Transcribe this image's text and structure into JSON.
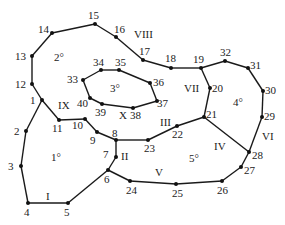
{
  "diagram": {
    "type": "planar-graph",
    "colors": {
      "stroke": "#1a1a1a",
      "text": "#222222",
      "background": "#ffffff"
    },
    "vertices": [
      {
        "id": "1",
        "x": 42,
        "y": 100,
        "lx": 30,
        "ly": 104
      },
      {
        "id": "2",
        "x": 26,
        "y": 131,
        "lx": 14,
        "ly": 135
      },
      {
        "id": "3",
        "x": 21,
        "y": 166,
        "lx": 8,
        "ly": 170
      },
      {
        "id": "4",
        "x": 28,
        "y": 203,
        "lx": 24,
        "ly": 216
      },
      {
        "id": "5",
        "x": 68,
        "y": 203,
        "lx": 64,
        "ly": 216
      },
      {
        "id": "6",
        "x": 108,
        "y": 170,
        "lx": 104,
        "ly": 183
      },
      {
        "id": "7",
        "x": 116,
        "y": 157,
        "lx": 103,
        "ly": 158
      },
      {
        "id": "8",
        "x": 116,
        "y": 140,
        "lx": 112,
        "ly": 137
      },
      {
        "id": "9",
        "x": 97,
        "y": 132,
        "lx": 90,
        "ly": 144
      },
      {
        "id": "10",
        "x": 85,
        "y": 119,
        "lx": 72,
        "ly": 129
      },
      {
        "id": "11",
        "x": 59,
        "y": 120,
        "lx": 52,
        "ly": 132
      },
      {
        "id": "12",
        "x": 32,
        "y": 84,
        "lx": 15,
        "ly": 88
      },
      {
        "id": "13",
        "x": 32,
        "y": 56,
        "lx": 15,
        "ly": 60
      },
      {
        "id": "14",
        "x": 52,
        "y": 33,
        "lx": 38,
        "ly": 33
      },
      {
        "id": "15",
        "x": 95,
        "y": 24,
        "lx": 88,
        "ly": 19
      },
      {
        "id": "16",
        "x": 116,
        "y": 37,
        "lx": 114,
        "ly": 33
      },
      {
        "id": "17",
        "x": 143,
        "y": 60,
        "lx": 139,
        "ly": 55
      },
      {
        "id": "18",
        "x": 171,
        "y": 68,
        "lx": 165,
        "ly": 62
      },
      {
        "id": "19",
        "x": 201,
        "y": 68,
        "lx": 193,
        "ly": 63
      },
      {
        "id": "20",
        "x": 210,
        "y": 88,
        "lx": 212,
        "ly": 92
      },
      {
        "id": "21",
        "x": 204,
        "y": 117,
        "lx": 206,
        "ly": 118
      },
      {
        "id": "22",
        "x": 177,
        "y": 126,
        "lx": 172,
        "ly": 138
      },
      {
        "id": "23",
        "x": 148,
        "y": 140,
        "lx": 144,
        "ly": 152
      },
      {
        "id": "24",
        "x": 130,
        "y": 181,
        "lx": 126,
        "ly": 194
      },
      {
        "id": "25",
        "x": 176,
        "y": 184,
        "lx": 172,
        "ly": 197
      },
      {
        "id": "26",
        "x": 222,
        "y": 181,
        "lx": 217,
        "ly": 194
      },
      {
        "id": "27",
        "x": 241,
        "y": 167,
        "lx": 244,
        "ly": 174
      },
      {
        "id": "28",
        "x": 249,
        "y": 152,
        "lx": 252,
        "ly": 159
      },
      {
        "id": "29",
        "x": 262,
        "y": 117,
        "lx": 264,
        "ly": 120
      },
      {
        "id": "30",
        "x": 263,
        "y": 91,
        "lx": 265,
        "ly": 94
      },
      {
        "id": "31",
        "x": 248,
        "y": 68,
        "lx": 250,
        "ly": 69
      },
      {
        "id": "32",
        "x": 225,
        "y": 61,
        "lx": 220,
        "ly": 56
      },
      {
        "id": "33",
        "x": 83,
        "y": 80,
        "lx": 67,
        "ly": 83
      },
      {
        "id": "34",
        "x": 101,
        "y": 70,
        "lx": 93,
        "ly": 66
      },
      {
        "id": "35",
        "x": 119,
        "y": 70,
        "lx": 115,
        "ly": 66
      },
      {
        "id": "36",
        "x": 150,
        "y": 83,
        "lx": 153,
        "ly": 86
      },
      {
        "id": "37",
        "x": 157,
        "y": 101,
        "lx": 157,
        "ly": 107
      },
      {
        "id": "38",
        "x": 133,
        "y": 108,
        "lx": 130,
        "ly": 119
      },
      {
        "id": "39",
        "x": 102,
        "y": 104,
        "lx": 95,
        "ly": 116
      },
      {
        "id": "40",
        "x": 90,
        "y": 98,
        "lx": 77,
        "ly": 107
      }
    ],
    "edges": [
      [
        "1",
        "2"
      ],
      [
        "2",
        "3"
      ],
      [
        "3",
        "4"
      ],
      [
        "4",
        "5"
      ],
      [
        "5",
        "6"
      ],
      [
        "6",
        "7"
      ],
      [
        "7",
        "8"
      ],
      [
        "8",
        "9"
      ],
      [
        "9",
        "10"
      ],
      [
        "10",
        "11"
      ],
      [
        "11",
        "1"
      ],
      [
        "1",
        "12"
      ],
      [
        "12",
        "13"
      ],
      [
        "13",
        "14"
      ],
      [
        "14",
        "15"
      ],
      [
        "15",
        "16"
      ],
      [
        "16",
        "17"
      ],
      [
        "17",
        "18"
      ],
      [
        "18",
        "19"
      ],
      [
        "19",
        "20"
      ],
      [
        "20",
        "21"
      ],
      [
        "21",
        "22"
      ],
      [
        "22",
        "23"
      ],
      [
        "23",
        "8"
      ],
      [
        "19",
        "32"
      ],
      [
        "32",
        "31"
      ],
      [
        "31",
        "30"
      ],
      [
        "30",
        "29"
      ],
      [
        "29",
        "28"
      ],
      [
        "28",
        "21"
      ],
      [
        "6",
        "24"
      ],
      [
        "24",
        "25"
      ],
      [
        "25",
        "26"
      ],
      [
        "26",
        "27"
      ],
      [
        "27",
        "28"
      ],
      [
        "33",
        "34"
      ],
      [
        "34",
        "35"
      ],
      [
        "35",
        "36"
      ],
      [
        "36",
        "37"
      ],
      [
        "37",
        "38"
      ],
      [
        "38",
        "39"
      ],
      [
        "39",
        "40"
      ],
      [
        "40",
        "33"
      ]
    ],
    "edge_labels": [
      {
        "text": "I",
        "x": 46,
        "y": 200
      },
      {
        "text": "II",
        "x": 121,
        "y": 160
      },
      {
        "text": "III",
        "x": 160,
        "y": 126
      },
      {
        "text": "IV",
        "x": 214,
        "y": 150
      },
      {
        "text": "V",
        "x": 155,
        "y": 176
      },
      {
        "text": "VI",
        "x": 262,
        "y": 140
      },
      {
        "text": "VII",
        "x": 184,
        "y": 92
      },
      {
        "text": "VIII",
        "x": 134,
        "y": 38
      },
      {
        "text": "IX",
        "x": 58,
        "y": 109
      },
      {
        "text": "X",
        "x": 119,
        "y": 119
      }
    ],
    "face_labels": [
      {
        "text": "1°",
        "x": 51,
        "y": 161
      },
      {
        "text": "2°",
        "x": 54,
        "y": 61
      },
      {
        "text": "3°",
        "x": 110,
        "y": 92
      },
      {
        "text": "4°",
        "x": 233,
        "y": 106
      },
      {
        "text": "5°",
        "x": 189,
        "y": 162
      }
    ]
  }
}
